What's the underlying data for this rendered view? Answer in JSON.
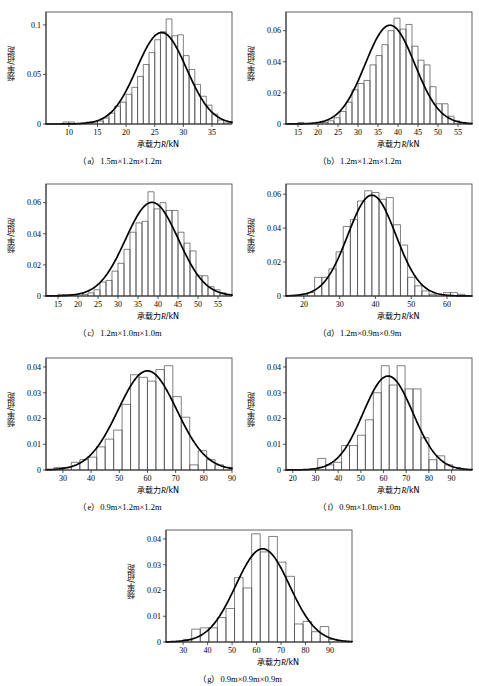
{
  "figure": {
    "ylabel": "频率/组距",
    "xlabel_cn": "承载力",
    "xlabel_sym": "R",
    "xlabel_unit": "/kN"
  },
  "chart_data": [
    {
      "id": "a",
      "type": "bar",
      "title": "（a）1.5m×1.2m×1.2m",
      "xlabel": "承载力R/kN",
      "ylabel": "频率/组距",
      "xlim": [
        6,
        38.5
      ],
      "ylim": [
        0,
        0.113
      ],
      "xticks": [
        10,
        15,
        20,
        25,
        30,
        35
      ],
      "yticks": [
        0,
        0.05,
        0.1
      ],
      "ytick_labels": [
        "0",
        "0.05",
        "0.1"
      ],
      "bin_width": 1.0,
      "bin_starts": [
        6,
        7,
        8,
        9,
        10,
        11,
        12,
        13,
        14,
        15,
        16,
        17,
        18,
        19,
        20,
        21,
        22,
        23,
        24,
        25,
        26,
        27,
        28,
        29,
        30,
        31,
        32,
        33,
        34,
        35,
        36,
        37
      ],
      "values": [
        0.0,
        0.0,
        0.0,
        0.002,
        0.002,
        0.0,
        0.001,
        0.002,
        0.002,
        0.003,
        0.006,
        0.011,
        0.018,
        0.022,
        0.03,
        0.037,
        0.048,
        0.06,
        0.072,
        0.085,
        0.093,
        0.106,
        0.089,
        0.09,
        0.069,
        0.055,
        0.04,
        0.028,
        0.019,
        0.01,
        0.004,
        0.001
      ],
      "curve": {
        "mean": 26.2,
        "sigma": 4.35,
        "peak": 0.0923
      }
    },
    {
      "id": "b",
      "type": "bar",
      "title": "（b）1.2m×1.2m×1.2m",
      "xlabel": "承载力R/kN",
      "ylabel": "频率/组距",
      "xlim": [
        12,
        58.5
      ],
      "ylim": [
        0,
        0.072
      ],
      "xticks": [
        15,
        20,
        25,
        30,
        35,
        40,
        45,
        50,
        55
      ],
      "yticks": [
        0,
        0.02,
        0.04,
        0.06
      ],
      "ytick_labels": [
        "0",
        "0.02",
        "0.04",
        "0.06"
      ],
      "bin_width": 1.5,
      "bin_starts": [
        12,
        13.5,
        15,
        16.5,
        18,
        19.5,
        21,
        22.5,
        24,
        25.5,
        27,
        28.5,
        30,
        31.5,
        33,
        34.5,
        36,
        37.5,
        39,
        40.5,
        42,
        43.5,
        45,
        46.5,
        48,
        49.5,
        51,
        52.5,
        54,
        55.5,
        57
      ],
      "values": [
        0.0,
        0.0,
        0.001,
        0.0,
        0.0,
        0.0,
        0.001,
        0.002,
        0.004,
        0.008,
        0.014,
        0.022,
        0.026,
        0.028,
        0.038,
        0.044,
        0.051,
        0.06,
        0.068,
        0.061,
        0.064,
        0.05,
        0.041,
        0.038,
        0.024,
        0.013,
        0.013,
        0.005,
        0.002,
        0.001,
        0.0
      ],
      "curve": {
        "mean": 38.0,
        "sigma": 6.2,
        "peak": 0.0635
      }
    },
    {
      "id": "c",
      "type": "bar",
      "title": "（c）1.2m×1.0m×1.0m",
      "xlabel": "承载力R/kN",
      "ylabel": "频率/组距",
      "xlim": [
        12,
        58.5
      ],
      "ylim": [
        0,
        0.072
      ],
      "xticks": [
        15,
        20,
        25,
        30,
        35,
        40,
        45,
        50,
        55
      ],
      "yticks": [
        0,
        0.02,
        0.04,
        0.06
      ],
      "ytick_labels": [
        "0",
        "0.02",
        "0.04",
        "0.06"
      ],
      "bin_width": 1.5,
      "bin_starts": [
        12,
        13.5,
        15,
        16.5,
        18,
        19.5,
        21,
        22.5,
        24,
        25.5,
        27,
        28.5,
        30,
        31.5,
        33,
        34.5,
        36,
        37.5,
        39,
        40.5,
        42,
        43.5,
        45,
        46.5,
        48,
        49.5,
        51,
        52.5,
        54,
        55.5,
        57
      ],
      "values": [
        0.0,
        0.0,
        0.001,
        0.001,
        0.001,
        0.0,
        0.001,
        0.002,
        0.004,
        0.009,
        0.01,
        0.016,
        0.021,
        0.03,
        0.041,
        0.047,
        0.048,
        0.067,
        0.056,
        0.06,
        0.055,
        0.055,
        0.041,
        0.034,
        0.029,
        0.013,
        0.013,
        0.006,
        0.004,
        0.002,
        0.001
      ],
      "curve": {
        "mean": 38.5,
        "sigma": 6.6,
        "peak": 0.0602
      }
    },
    {
      "id": "d",
      "type": "bar",
      "title": "（d）1.2m×0.9m×0.9m",
      "xlabel": "承载力R/kN",
      "ylabel": "频率/组距",
      "xlim": [
        15,
        67
      ],
      "ylim": [
        0,
        0.066
      ],
      "xticks": [
        20,
        30,
        40,
        50,
        60
      ],
      "yticks": [
        0,
        0.02,
        0.04,
        0.06
      ],
      "ytick_labels": [
        "0",
        "0.02",
        "0.04",
        "0.06"
      ],
      "bin_width": 2.0,
      "bin_starts": [
        15,
        17,
        19,
        21,
        23,
        25,
        27,
        29,
        31,
        33,
        35,
        37,
        39,
        41,
        43,
        45,
        47,
        49,
        51,
        53,
        55,
        57,
        59,
        61,
        63,
        65
      ],
      "values": [
        0.0,
        0.0,
        0.001,
        0.002,
        0.011,
        0.011,
        0.016,
        0.026,
        0.041,
        0.045,
        0.056,
        0.062,
        0.061,
        0.057,
        0.058,
        0.042,
        0.03,
        0.011,
        0.006,
        0.003,
        0.001,
        0.0,
        0.002,
        0.002,
        0.001,
        0.0
      ],
      "curve": {
        "mean": 39.0,
        "sigma": 6.7,
        "peak": 0.0594
      }
    },
    {
      "id": "e",
      "type": "bar",
      "title": "（e）0.9m×1.2m×1.2m",
      "xlabel": "承载力R/kN",
      "ylabel": "频率/组距",
      "xlim": [
        24,
        90
      ],
      "ylim": [
        0,
        0.0435
      ],
      "xticks": [
        30,
        40,
        50,
        60,
        70,
        80,
        90
      ],
      "yticks": [
        0,
        0.01,
        0.02,
        0.03,
        0.04
      ],
      "ytick_labels": [
        "0",
        "0.01",
        "0.02",
        "0.03",
        "0.04"
      ],
      "bin_width": 3.0,
      "bin_starts": [
        24,
        27,
        30,
        33,
        36,
        39,
        42,
        45,
        48,
        51,
        54,
        57,
        60,
        63,
        66,
        69,
        72,
        75,
        78,
        81,
        84,
        87
      ],
      "values": [
        0.0,
        0.001,
        0.001,
        0.003,
        0.004,
        0.005,
        0.009,
        0.012,
        0.0155,
        0.0255,
        0.037,
        0.036,
        0.0345,
        0.039,
        0.0405,
        0.0285,
        0.0205,
        0.002,
        0.0075,
        0.004,
        0.002,
        0.001
      ],
      "curve": {
        "mean": 60.0,
        "sigma": 10.4,
        "peak": 0.0385
      }
    },
    {
      "id": "f",
      "type": "bar",
      "title": "（f）0.9m×1.0m×1.0m",
      "xlabel": "承载力R/kN",
      "ylabel": "频率/组距",
      "xlim": [
        17,
        99
      ],
      "ylim": [
        0,
        0.0435
      ],
      "xticks": [
        20,
        30,
        40,
        50,
        60,
        70,
        80,
        90
      ],
      "yticks": [
        0,
        0.01,
        0.02,
        0.03,
        0.04
      ],
      "ytick_labels": [
        "0",
        "0.01",
        "0.02",
        "0.03",
        "0.04"
      ],
      "bin_width": 3.5,
      "bin_starts": [
        17,
        20.5,
        24,
        27.5,
        31,
        34.5,
        38,
        41.5,
        45,
        48.5,
        52,
        55.5,
        59,
        62.5,
        66,
        69.5,
        73,
        76.5,
        80,
        83.5,
        87,
        90.5,
        94
      ],
      "values": [
        0.0,
        0.0,
        0.0,
        0.0,
        0.0045,
        0.002,
        0.003,
        0.0095,
        0.0095,
        0.0135,
        0.0195,
        0.03,
        0.0405,
        0.033,
        0.0405,
        0.0315,
        0.0315,
        0.0125,
        0.004,
        0.0055,
        0.002,
        0.001,
        0.0
      ],
      "curve": {
        "mean": 62.0,
        "sigma": 11.0,
        "peak": 0.0365
      }
    },
    {
      "id": "g",
      "type": "bar",
      "title": "（g）0.9m×0.9m×0.9m",
      "xlabel": "承载力R/kN",
      "ylabel": "频率/组距",
      "xlim": [
        23,
        99
      ],
      "ylim": [
        0,
        0.0435
      ],
      "xticks": [
        30,
        40,
        50,
        60,
        70,
        80,
        90
      ],
      "yticks": [
        0,
        0.01,
        0.02,
        0.03,
        0.04
      ],
      "ytick_labels": [
        "0",
        "0.01",
        "0.02",
        "0.03",
        "0.04"
      ],
      "bin_width": 3.5,
      "bin_starts": [
        23,
        26.5,
        30,
        33.5,
        37,
        40.5,
        44,
        47.5,
        51,
        54.5,
        58,
        61.5,
        65,
        68.5,
        72,
        75.5,
        79,
        82.5,
        86,
        89.5,
        93
      ],
      "values": [
        0.0,
        0.0,
        0.001,
        0.005,
        0.0055,
        0.0055,
        0.0095,
        0.013,
        0.025,
        0.021,
        0.042,
        0.035,
        0.041,
        0.031,
        0.0255,
        0.007,
        0.008,
        0.004,
        0.006,
        0.001,
        0.0
      ],
      "curve": {
        "mean": 62.5,
        "sigma": 11.0,
        "peak": 0.0362
      }
    }
  ]
}
